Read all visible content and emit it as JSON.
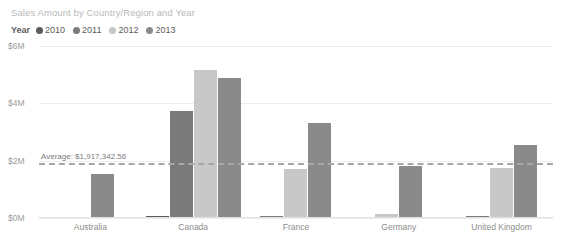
{
  "chart_data": {
    "type": "bar",
    "title": "Sales Amount by Country/Region and Year",
    "xlabel": "",
    "ylabel": "",
    "grid": true,
    "legend_position": "top-left",
    "legend_title": "Year",
    "categories": [
      "Australia",
      "Canada",
      "France",
      "Germany",
      "United Kingdom"
    ],
    "ylim": [
      0,
      6000000
    ],
    "ytick_labels": [
      "$0M",
      "$2M",
      "$4M",
      "$6M"
    ],
    "ytick_values": [
      0,
      2000000,
      4000000,
      6000000
    ],
    "series": [
      {
        "name": "2010",
        "color": "#5c5c5c",
        "values": [
          0,
          80000,
          0,
          0,
          0
        ]
      },
      {
        "name": "2011",
        "color": "#7a7a7a",
        "values": [
          0,
          3720000,
          60000,
          0,
          70000
        ]
      },
      {
        "name": "2012",
        "color": "#c8c8c8",
        "values": [
          30000,
          5150000,
          1700000,
          150000,
          1750000
        ]
      },
      {
        "name": "2013",
        "color": "#8a8a8a",
        "values": [
          1550000,
          4870000,
          3300000,
          1830000,
          2550000
        ]
      }
    ],
    "reference_line": {
      "label": "Average: $1,917,342.56",
      "value": 1917342.56,
      "style": "dashed",
      "color": "#a7a7a7"
    }
  },
  "colors": {
    "background": "#ffffff",
    "title": "#b9b9b9",
    "gridline": "#ededed",
    "axis_text": "#9a9a9a",
    "legend_text": "#5c5c5c"
  }
}
